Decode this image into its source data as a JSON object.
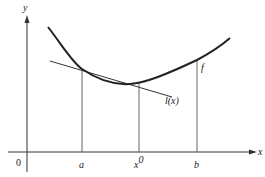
{
  "diagram": {
    "axes": {
      "x_label": "x",
      "y_label": "y",
      "origin_label": "0"
    },
    "ticks": [
      {
        "id": "a",
        "label": "a"
      },
      {
        "id": "x0",
        "label": "x",
        "superscript": "0"
      },
      {
        "id": "b",
        "label": "b"
      }
    ],
    "curves": {
      "function_label": "f",
      "tangent_label": "l(x)"
    },
    "colors": {
      "ink": "#222222",
      "background": "#ffffff"
    }
  }
}
